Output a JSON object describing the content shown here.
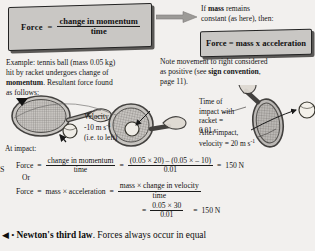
{
  "page": {
    "background_color": "#f2f0ee",
    "box_fill_color": "#c9c7c4",
    "box_border_color": "#232323",
    "shadow_color": "#5a5856"
  },
  "formula_box_1": {
    "name": "force-equals-change-in-momentum-over-time",
    "lhs": "Force",
    "equals": "=",
    "numerator": "change in momentum",
    "denominator": "time"
  },
  "arrow": {
    "icon": "right-arrow-icon",
    "direction": "right"
  },
  "condition_note": {
    "line1_prefix": "If ",
    "line1_bold": "mass",
    "line1_suffix": " remains",
    "line2": "constant (as here), then:"
  },
  "formula_box_2": {
    "name": "force-equals-mass-times-acceleration",
    "text": "Force = mass x acceleration"
  },
  "example": {
    "line1": "Example: tennis ball (mass 0.05 kg)",
    "line2": "hit by racket undergoes change of",
    "line3_bold": "momentum",
    "line3_rest": ". Resultant force found",
    "line4": "as follows:"
  },
  "note": {
    "line1": "Note movement to right considered",
    "line2_prefix": "as positive (see ",
    "line2_bold": "sign convention",
    "line2_suffix": ",",
    "line3": "page 11)."
  },
  "annotations": {
    "velocity_label": "Velocity",
    "velocity_value": "-10 m s",
    "velocity_exponent": "-1",
    "velocity_direction": "(i.e. to left)",
    "at_impact": "At impact:",
    "time_of_impact_line1": "Time of",
    "time_of_impact_line2": "impact with",
    "time_of_impact_line3": "racket =",
    "time_of_impact_value": "0.01 s",
    "after_impact_line1": "After impact,",
    "after_impact_line2": "velocity = 20 m s",
    "after_impact_exponent": "-1"
  },
  "derivation": {
    "row1": {
      "lhs": "Force",
      "eq1": "=",
      "num": "change in momentum",
      "den": "time",
      "eq2": "=",
      "rhs_num": "(0.05 × 20) – (0.05 × – 10)",
      "rhs_den": "0.01",
      "eq3": "=",
      "result": "150 N"
    },
    "or_label": "Or",
    "row2": {
      "lhs": "Force",
      "eq1": "=",
      "mid": "mass  ×  acceleration",
      "eq2": "=",
      "rhs_num": "mass  ×  change in velocity",
      "rhs_den": "time"
    },
    "row3": {
      "eq1": "=",
      "rhs_num": "0.05  ×  30",
      "rhs_den": "0.01",
      "eq2": "=",
      "result": "150 N"
    },
    "side_letter": "S"
  },
  "bottom_caption": {
    "marker": "◀ • ",
    "bold": "Newton's third law",
    "rest": ". Forces always occur in equal"
  }
}
